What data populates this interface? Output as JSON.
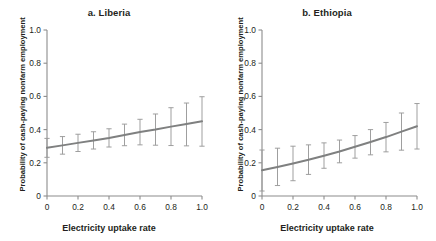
{
  "figure": {
    "background": "#ffffff",
    "line_color": "#7f8080",
    "errorbar_color": "#9a9a9a",
    "axis_color": "#8c8c8c",
    "text_color": "#231f20"
  },
  "chart_data": [
    {
      "type": "line",
      "title": "a. Liberia",
      "xlabel": "Electricity uptake rate",
      "ylabel": "Probability of cash-paying nonfarm employment",
      "xlim": [
        0,
        1.0
      ],
      "ylim": [
        0,
        1.0
      ],
      "xticks": [
        0,
        0.2,
        0.4,
        0.6,
        0.8,
        1.0
      ],
      "xtick_labels": [
        "0",
        "0.2",
        "0.4",
        "0.6",
        "0.8",
        "1.0"
      ],
      "yticks": [
        0,
        0.2,
        0.4,
        0.6,
        0.8,
        1.0
      ],
      "ytick_labels": [
        "0",
        "0.2",
        "0.4",
        "0.6",
        "0.8",
        "1.0"
      ],
      "grid": false,
      "legend": false,
      "x": [
        0,
        0.1,
        0.2,
        0.3,
        0.4,
        0.5,
        0.6,
        0.7,
        0.8,
        0.9,
        1.0
      ],
      "values": [
        0.29,
        0.305,
        0.32,
        0.335,
        0.35,
        0.368,
        0.385,
        0.4,
        0.418,
        0.434,
        0.45
      ],
      "error_low": [
        0.233,
        0.252,
        0.268,
        0.283,
        0.295,
        0.303,
        0.308,
        0.306,
        0.304,
        0.302,
        0.3
      ],
      "error_high": [
        0.347,
        0.358,
        0.372,
        0.387,
        0.405,
        0.433,
        0.462,
        0.494,
        0.532,
        0.56,
        0.598
      ]
    },
    {
      "type": "line",
      "title": "b. Ethiopia",
      "xlabel": "Electricity uptake rate",
      "ylabel": "Probability of cash-paying nonfarm employment",
      "xlim": [
        0,
        1.0
      ],
      "ylim": [
        0,
        1.0
      ],
      "xticks": [
        0,
        0.2,
        0.4,
        0.6,
        0.8,
        1.0
      ],
      "xtick_labels": [
        "0",
        "0.2",
        "0.4",
        "0.6",
        "0.8",
        "1.0"
      ],
      "yticks": [
        0,
        0.2,
        0.4,
        0.6,
        0.8,
        1.0
      ],
      "ytick_labels": [
        "0",
        "0.2",
        "0.4",
        "0.6",
        "0.8",
        "1.0"
      ],
      "grid": false,
      "legend": false,
      "x": [
        0,
        0.1,
        0.2,
        0.3,
        0.4,
        0.5,
        0.6,
        0.7,
        0.8,
        0.9,
        1.0
      ],
      "values": [
        0.155,
        0.175,
        0.196,
        0.218,
        0.243,
        0.268,
        0.297,
        0.325,
        0.355,
        0.388,
        0.42
      ],
      "error_low": [
        0.03,
        0.063,
        0.092,
        0.13,
        0.167,
        0.2,
        0.228,
        0.248,
        0.266,
        0.276,
        0.283
      ],
      "error_high": [
        0.277,
        0.288,
        0.3,
        0.308,
        0.32,
        0.337,
        0.364,
        0.4,
        0.443,
        0.5,
        0.557
      ]
    }
  ]
}
